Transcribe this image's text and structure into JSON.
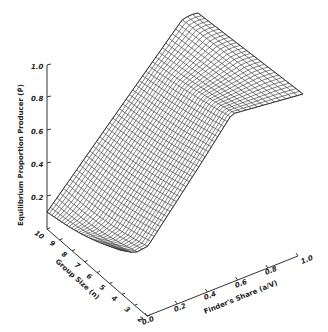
{
  "chart_data": {
    "type": "surface3d",
    "title": "",
    "zlabel": "Equilibrium Proportion Producer (P̂)",
    "xlabel": "Finder's Share (a/V)",
    "ylabel": "Group Size (n)",
    "z_ticks": [
      "0.2",
      "0.4",
      "0.6",
      "0.8",
      "1.0"
    ],
    "x_ticks": [
      "0.0",
      "0.2",
      "0.4",
      "0.6",
      "0.8",
      "1.0"
    ],
    "y_ticks": [
      "2",
      "3",
      "4",
      "5",
      "6",
      "7",
      "8",
      "9",
      "10"
    ],
    "zlim": [
      0,
      1.0
    ],
    "xlim": [
      0,
      1.0
    ],
    "ylim": [
      2,
      10
    ],
    "surface_samples": {
      "n": [
        2,
        10
      ],
      "a_over_V": [
        0.0,
        0.2,
        0.4,
        0.6,
        0.8,
        1.0
      ],
      "P_at_n10": [
        0.1,
        0.3,
        0.5,
        0.7,
        0.9,
        1.0
      ],
      "P_at_n2": [
        0.1,
        0.12,
        0.4,
        0.75,
        1.0,
        1.0
      ]
    }
  }
}
